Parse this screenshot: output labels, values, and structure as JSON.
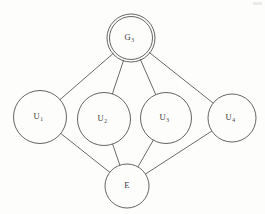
{
  "diagram": {
    "type": "node-link-graph",
    "background_color": "#fdfdfc",
    "stroke_color": "#5a5a5a",
    "nodes": [
      {
        "id": "G3",
        "label": "G",
        "subscript": "3",
        "full_label": "G3",
        "role": "goal-node",
        "shape": "double-circle",
        "cx": 131,
        "cy": 38,
        "r": 21.5,
        "r_outer": 24
      },
      {
        "id": "U1",
        "label": "U",
        "subscript": "1",
        "full_label": "U1",
        "role": "user-node",
        "shape": "circle",
        "cx": 40,
        "cy": 117,
        "r": 26.5,
        "r_outer": 26.5
      },
      {
        "id": "U2",
        "label": "U",
        "subscript": "2",
        "full_label": "U2",
        "role": "user-node",
        "shape": "circle",
        "cx": 104,
        "cy": 119,
        "r": 26.5,
        "r_outer": 26.5
      },
      {
        "id": "U3",
        "label": "U",
        "subscript": "3",
        "full_label": "U3",
        "role": "user-node",
        "shape": "circle",
        "cx": 166,
        "cy": 118,
        "r": 25.5,
        "r_outer": 25.5
      },
      {
        "id": "U4",
        "label": "U",
        "subscript": "4",
        "full_label": "U4",
        "role": "user-node",
        "shape": "circle",
        "cx": 232,
        "cy": 118,
        "r": 24,
        "r_outer": 24
      },
      {
        "id": "E",
        "label": "E",
        "subscript": "",
        "full_label": "E",
        "role": "environment-node",
        "shape": "circle",
        "cx": 127,
        "cy": 186,
        "r": 22,
        "r_outer": 22
      }
    ],
    "edges": [
      {
        "id": "G3-U1",
        "from": "G3",
        "to": "U1"
      },
      {
        "id": "G3-U2",
        "from": "G3",
        "to": "U2"
      },
      {
        "id": "G3-U3",
        "from": "G3",
        "to": "U3"
      },
      {
        "id": "G3-U4",
        "from": "G3",
        "to": "U4"
      },
      {
        "id": "U1-E",
        "from": "U1",
        "to": "E"
      },
      {
        "id": "U2-E",
        "from": "U2",
        "to": "E"
      },
      {
        "id": "U3-E",
        "from": "U3",
        "to": "E"
      },
      {
        "id": "U4-E",
        "from": "U4",
        "to": "E"
      }
    ]
  }
}
